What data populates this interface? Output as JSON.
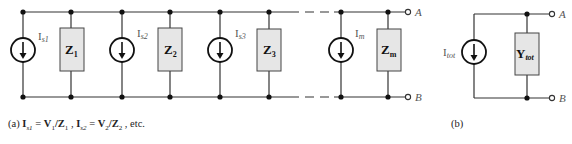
{
  "panel_a": {
    "branches": [
      {
        "source_label": "I",
        "source_sub": "s1",
        "impedance_label": "Z",
        "impedance_sub": "1"
      },
      {
        "source_label": "I",
        "source_sub": "s2",
        "impedance_label": "Z",
        "impedance_sub": "2"
      },
      {
        "source_label": "I",
        "source_sub": "s3",
        "impedance_label": "Z",
        "impedance_sub": "3"
      },
      {
        "source_label": "I",
        "source_sub": "m",
        "impedance_label": "Z",
        "impedance_sub": "m"
      }
    ],
    "terminal_top": "A",
    "terminal_bottom": "B",
    "caption": {
      "tag": "(a)",
      "eq1_lhs": "I",
      "eq1_lhs_sub": "s1",
      "eq1_eq": " = ",
      "eq1_v": "V",
      "eq1_v_sub": "1",
      "eq1_z": "/Z",
      "eq1_z_sub": "1",
      "sep": " , ",
      "eq2_lhs": "I",
      "eq2_lhs_sub": "s2",
      "eq2_eq": " = ",
      "eq2_v": "V",
      "eq2_v_sub": "2",
      "eq2_z": "/Z",
      "eq2_z_sub": "2",
      "tail": " , etc."
    }
  },
  "panel_b": {
    "source_label": "I",
    "source_sub": "tot",
    "admittance_label": "Y",
    "admittance_sub": "tot",
    "terminal_top": "A",
    "terminal_bottom": "B",
    "caption": "(b)"
  }
}
